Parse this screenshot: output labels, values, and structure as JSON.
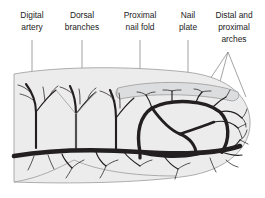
{
  "figure": {
    "background_color": "#ffffff",
    "skin_fill": "#ececed",
    "nail_fill": "#d9dada",
    "vessel_color": "#231f20",
    "leader_color": "#8c8c8c",
    "outline_color": "#9a9a9a"
  },
  "labels": [
    {
      "id": "digital-artery",
      "line1": "Digital",
      "line2": "artery",
      "line3": "",
      "x": 32,
      "lead_x": 32,
      "lead_y0": 40,
      "lead_y1": 146
    },
    {
      "id": "dorsal-branches",
      "line1": "Dorsal",
      "line2": "branches",
      "line3": "",
      "x": 82,
      "lead_x": 82,
      "lead_y0": 40,
      "lead_y1": 118
    },
    {
      "id": "proximal-nail-fold",
      "line1": "Proximal",
      "line2": "nail fold",
      "line3": "",
      "x": 140,
      "lead_x": 140,
      "lead_y0": 40,
      "lead_y1": 80
    },
    {
      "id": "nail-plate",
      "line1": "Nail",
      "line2": "plate",
      "line3": "",
      "x": 188,
      "lead_x": 188,
      "lead_y0": 40,
      "lead_y1": 86
    },
    {
      "id": "distal-proximal-arches",
      "line1": "Distal and",
      "line2": "proximal",
      "line3": "arches",
      "x": 234,
      "lead_x": 228,
      "lead_y0": 52,
      "lead_y1": 52
    }
  ],
  "anatomy": [
    {
      "id": "finger-skin",
      "name": "finger soft tissue outline"
    },
    {
      "id": "nail-plate-shape",
      "name": "nail plate"
    },
    {
      "id": "proximal-nail-fold-shape",
      "name": "proximal nail fold crease"
    },
    {
      "id": "digital-artery-vessel",
      "name": "digital artery trunk"
    },
    {
      "id": "dorsal-branch-vessels",
      "name": "dorsal branches"
    },
    {
      "id": "proximal-arch-vessel",
      "name": "proximal arch"
    },
    {
      "id": "distal-arch-vessel",
      "name": "distal arch"
    },
    {
      "id": "terminal-capillaries",
      "name": "terminal capillary tufts"
    }
  ]
}
